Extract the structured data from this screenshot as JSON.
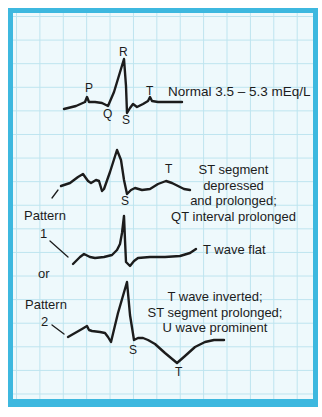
{
  "colors": {
    "border": "#3db8df",
    "grid_background": "#eef9fc",
    "grid_lines": "#bde4ef",
    "trace": "#1c1c1c"
  },
  "normal": {
    "wave_labels": {
      "P": "P",
      "Q": "Q",
      "R": "R",
      "S": "S",
      "T": "T"
    },
    "caption": "Normal 3.5 – 5.3 mEq/L"
  },
  "pattern1": {
    "label_line1": "Pattern",
    "label_line2": "1",
    "trace_a": {
      "wave_labels": {
        "S": "S",
        "T": "T"
      },
      "description": [
        "ST segment",
        "depressed",
        "and prolonged;",
        "QT interval  prolonged"
      ]
    },
    "trace_b": {
      "description": [
        "T wave flat"
      ]
    }
  },
  "connector": "or",
  "pattern2": {
    "label_line1": "Pattern",
    "label_line2": "2",
    "wave_labels": {
      "S": "S",
      "T": "T"
    },
    "description": [
      "T wave inverted;",
      "ST segment prolonged;",
      "U wave prominent"
    ]
  }
}
